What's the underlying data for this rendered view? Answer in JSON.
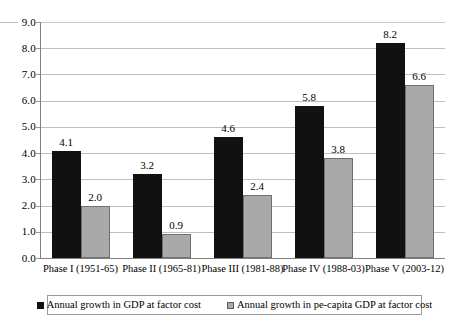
{
  "chart_data": {
    "type": "bar",
    "title": "",
    "xlabel": "",
    "ylabel": "",
    "ylim": [
      0,
      9
    ],
    "ytick_step": 1,
    "grid": true,
    "legend_position": "bottom",
    "categories": [
      "Phase I (1951-65)",
      "Phase II (1965-81)",
      "Phase III (1981-88)",
      "Phase IV (1988-03)",
      "Phase V (2003-12)"
    ],
    "ytick_labels": [
      "0.0",
      "1.0",
      "2.0",
      "3.0",
      "4.0",
      "5.0",
      "6.0",
      "7.0",
      "8.0",
      "9.0"
    ],
    "ytick_values": [
      0,
      1,
      2,
      3,
      4,
      5,
      6,
      7,
      8,
      9
    ],
    "series": [
      {
        "name": "Annual growth in GDP at factor cost",
        "color": "#111111",
        "values": [
          4.1,
          3.2,
          4.6,
          5.8,
          8.2
        ],
        "labels": [
          "4.1",
          "3.2",
          "4.6",
          "5.8",
          "8.2"
        ]
      },
      {
        "name": "Annual growth in pe-capita GDP at factor cost",
        "color": "#a9a9a9",
        "values": [
          2.0,
          0.9,
          2.4,
          3.8,
          6.6
        ],
        "labels": [
          "2.0",
          "0.9",
          "2.4",
          "3.8",
          "6.6"
        ]
      }
    ]
  },
  "legend": {
    "items": [
      {
        "label": "Annual growth in GDP at factor cost",
        "swatch": "black-square-swatch"
      },
      {
        "label": "Annual growth in pe-capita GDP at factor cost",
        "swatch": "gray-square-swatch"
      }
    ]
  }
}
